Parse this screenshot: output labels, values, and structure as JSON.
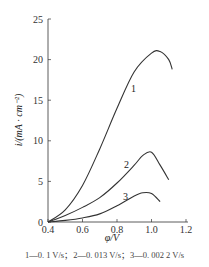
{
  "chart_data": {
    "type": "line",
    "title": "",
    "xlabel": "φ/V",
    "ylabel": "i/(mA · cm⁻²)",
    "xlim": [
      0.4,
      1.2
    ],
    "ylim": [
      0,
      25
    ],
    "xticks": [
      "0.4",
      "0.6",
      "0.8",
      "1.0",
      "1.2"
    ],
    "yticks": [
      "0",
      "5",
      "10",
      "15",
      "20",
      "25"
    ],
    "grid": false,
    "series": [
      {
        "name": "1",
        "scan_rate": "0.1 V/s",
        "x": [
          0.4,
          0.5,
          0.6,
          0.7,
          0.8,
          0.9,
          1.0,
          1.05,
          1.1,
          1.12
        ],
        "y": [
          0,
          1.5,
          4.5,
          9.0,
          14.0,
          18.5,
          20.8,
          21.0,
          20.0,
          18.8
        ]
      },
      {
        "name": "2",
        "scan_rate": "0.013 V/s",
        "x": [
          0.4,
          0.5,
          0.6,
          0.7,
          0.8,
          0.9,
          0.95,
          1.0,
          1.05,
          1.1
        ],
        "y": [
          0,
          0.8,
          1.8,
          3.0,
          4.8,
          7.0,
          8.2,
          8.6,
          7.0,
          5.2
        ]
      },
      {
        "name": "3",
        "scan_rate": "0.002 2 V/s",
        "x": [
          0.4,
          0.5,
          0.6,
          0.7,
          0.8,
          0.9,
          0.95,
          1.0,
          1.05
        ],
        "y": [
          0,
          0.2,
          0.5,
          1.0,
          2.0,
          3.2,
          3.6,
          3.5,
          2.5
        ]
      }
    ]
  },
  "labels": {
    "xlabel": "φ/V",
    "ylabel": "i/(mA · cm⁻²)",
    "series1": "1",
    "series2": "2",
    "series3": "3",
    "caption": "1—0. 1 V/s；2—0. 013 V/s；3—0. 002 2 V/s",
    "xticks": [
      "0.4",
      "0.6",
      "0.8",
      "1.0",
      "1.2"
    ],
    "yticks": [
      "0",
      "5",
      "10",
      "15",
      "20",
      "25"
    ]
  }
}
